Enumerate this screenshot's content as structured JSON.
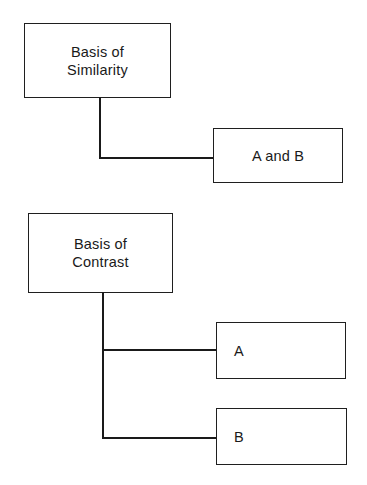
{
  "diagram": {
    "similarity": {
      "basis_label": "Basis of\nSimilarity",
      "children": [
        {
          "label": "A and B"
        }
      ]
    },
    "contrast": {
      "basis_label": "Basis of\nContrast",
      "children": [
        {
          "label": "A"
        },
        {
          "label": "B"
        }
      ]
    }
  }
}
